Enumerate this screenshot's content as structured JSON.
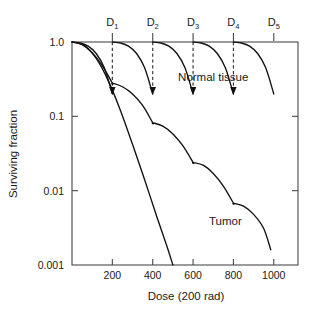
{
  "chart_data": {
    "type": "line",
    "title": "",
    "xlabel": "Dose (200 rad)",
    "ylabel": "Surviving fraction",
    "xlim": [
      0,
      1120
    ],
    "ylim": [
      0.001,
      1.0
    ],
    "yscale": "log",
    "grid": false,
    "legend_position": "inline-annotations",
    "xticks": [
      200,
      400,
      600,
      800,
      1000
    ],
    "xtick_labels": [
      "200",
      "400",
      "600",
      "800",
      "1000"
    ],
    "yticks": [
      1.0,
      0.1,
      0.01,
      0.001
    ],
    "ytick_labels": [
      "1.0",
      "0.1",
      "0.01",
      "0.001"
    ],
    "fraction_marker_labels": [
      "D",
      "D",
      "D",
      "D",
      "D"
    ],
    "fraction_marker_subscripts": [
      "1",
      "2",
      "3",
      "4",
      "5"
    ],
    "fraction_doses": [
      200,
      400,
      600,
      800,
      1000
    ],
    "series": [
      {
        "name": "Normal tissue",
        "description": "Fractionated normal tissue survival, shoulder repeats each fraction",
        "points": [
          [
            0,
            1.0
          ],
          [
            40,
            0.97
          ],
          [
            80,
            0.88
          ],
          [
            120,
            0.7
          ],
          [
            160,
            0.45
          ],
          [
            200,
            0.2
          ],
          [
            200,
            1.0
          ],
          [
            240,
            0.97
          ],
          [
            280,
            0.88
          ],
          [
            320,
            0.7
          ],
          [
            360,
            0.45
          ],
          [
            400,
            0.2
          ],
          [
            400,
            1.0
          ],
          [
            440,
            0.97
          ],
          [
            480,
            0.88
          ],
          [
            520,
            0.7
          ],
          [
            560,
            0.45
          ],
          [
            600,
            0.2
          ],
          [
            600,
            1.0
          ],
          [
            640,
            0.97
          ],
          [
            680,
            0.88
          ],
          [
            720,
            0.7
          ],
          [
            760,
            0.45
          ],
          [
            800,
            0.2
          ],
          [
            800,
            1.0
          ],
          [
            840,
            0.97
          ],
          [
            880,
            0.88
          ],
          [
            920,
            0.7
          ],
          [
            960,
            0.45
          ],
          [
            1000,
            0.2
          ]
        ]
      },
      {
        "name": "Tumor",
        "description": "Fractionated tumor survival with smaller shoulder, cumulative kill",
        "points": [
          [
            0,
            1.0
          ],
          [
            50,
            0.92
          ],
          [
            100,
            0.72
          ],
          [
            150,
            0.48
          ],
          [
            200,
            0.28
          ],
          [
            200,
            0.28
          ],
          [
            250,
            0.25
          ],
          [
            300,
            0.2
          ],
          [
            350,
            0.14
          ],
          [
            400,
            0.082
          ],
          [
            400,
            0.082
          ],
          [
            450,
            0.074
          ],
          [
            500,
            0.058
          ],
          [
            550,
            0.04
          ],
          [
            600,
            0.024
          ],
          [
            600,
            0.024
          ],
          [
            650,
            0.022
          ],
          [
            700,
            0.017
          ],
          [
            750,
            0.0115
          ],
          [
            800,
            0.0068
          ],
          [
            800,
            0.0068
          ],
          [
            850,
            0.0062
          ],
          [
            900,
            0.0048
          ],
          [
            950,
            0.0031
          ],
          [
            985,
            0.0016
          ]
        ]
      },
      {
        "name": "Tumor single acute dose",
        "description": "Unfractionated tumor curve, steep continuous fall below 0.001",
        "points": [
          [
            0,
            1.0
          ],
          [
            60,
            0.9
          ],
          [
            120,
            0.6
          ],
          [
            180,
            0.3
          ],
          [
            240,
            0.12
          ],
          [
            300,
            0.042
          ],
          [
            360,
            0.014
          ],
          [
            420,
            0.0045
          ],
          [
            470,
            0.0018
          ],
          [
            500,
            0.001
          ]
        ]
      }
    ],
    "annotations": [
      {
        "text": "Normal tissue",
        "x": 700,
        "y": 0.3
      },
      {
        "text": "Tumor",
        "x": 760,
        "y": 0.0034
      }
    ],
    "repair_arrows": [
      {
        "dose": 200,
        "from": 1.0,
        "to": 0.2
      },
      {
        "dose": 400,
        "from": 1.0,
        "to": 0.2
      },
      {
        "dose": 600,
        "from": 1.0,
        "to": 0.2
      },
      {
        "dose": 800,
        "from": 1.0,
        "to": 0.2
      }
    ]
  },
  "colors": {
    "background": "#ffffff",
    "curve": "#111111",
    "axis": "#4a4a4a",
    "text": "#1a1a1a"
  }
}
